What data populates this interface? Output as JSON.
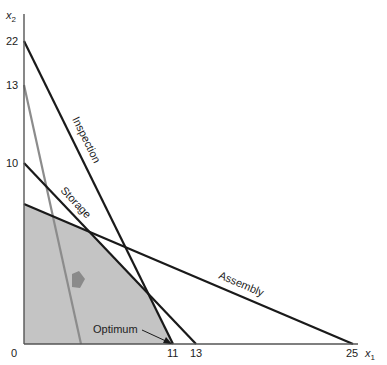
{
  "diagram": {
    "axes": {
      "x_label": "x",
      "x_sub": "1",
      "y_label": "x",
      "y_sub": "2",
      "origin_label": "0",
      "x_ticks": [
        "11",
        "13",
        "25"
      ],
      "y_ticks": [
        "22",
        "13",
        "10"
      ]
    },
    "constraints": [
      {
        "name": "Inspection",
        "x_intercept": 11,
        "y_intercept": 22
      },
      {
        "name": "Storage",
        "x_intercept": 13,
        "y_intercept": 10
      },
      {
        "name": "Assembly",
        "x_intercept": 25,
        "y_intercept": 8
      }
    ],
    "objective_line": {
      "label": "",
      "y_intercept": 13
    },
    "annotation": "Optimum",
    "colors": {
      "feasible_region": "#c4c4c4",
      "lines": "#1a1a1a",
      "objective_line": "#8c8c8c",
      "arrow": "#8a8a8a"
    }
  }
}
